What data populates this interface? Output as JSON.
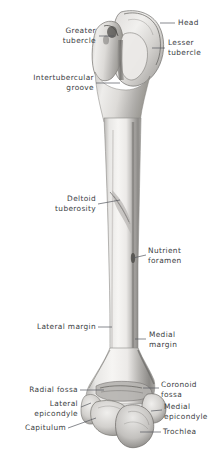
{
  "figure": {
    "background_color": "#ffffff",
    "label_color": "#3a3d42",
    "leader_line_color": "#55585e",
    "bone_light": "#f2f1ef",
    "bone_mid": "#c9c7c4",
    "bone_dark": "#8d8b88",
    "bone_shadow": "#6b6966"
  },
  "labels": {
    "greater_tubercle": "Greater\ntubercle",
    "head": "Head",
    "lesser_tubercle": "Lesser\ntubercle",
    "intertubercular_groove": "Intertubercular\ngroove",
    "deltoid_tuberosity": "Deltoid\ntuberosity",
    "nutrient_foramen": "Nutrient\nforamen",
    "lateral_margin": "Lateral margin",
    "medial_margin": "Medial\nmargin",
    "radial_fossa": "Radial fossa",
    "coronoid_fossa": "Coronoid\nfossa",
    "lateral_epicondyle": "Lateral\nepicondyle",
    "medial_epicondyle": "Medial\nepicondyle",
    "capitulum": "Capitulum",
    "trochlea": "Trochlea"
  }
}
